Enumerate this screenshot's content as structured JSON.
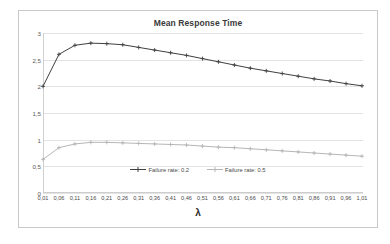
{
  "chart_data": {
    "type": "line",
    "title": "Mean Response Time",
    "xlabel": "λ",
    "ylabel": "",
    "xlim": [
      0.01,
      1.01
    ],
    "ylim": [
      0,
      3
    ],
    "grid": true,
    "legend_position": "inside-bottom-center",
    "x": [
      0.01,
      0.06,
      0.11,
      0.16,
      0.21,
      0.26,
      0.31,
      0.36,
      0.41,
      0.46,
      0.51,
      0.56,
      0.61,
      0.66,
      0.71,
      0.76,
      0.81,
      0.86,
      0.91,
      0.96,
      1.01
    ],
    "xtick_labels": [
      "0,01",
      "0,06",
      "0,11",
      "0,16",
      "0,21",
      "0,26",
      "0,31",
      "0,36",
      "0,41",
      "0,46",
      "0,51",
      "0,56",
      "0,61",
      "0,66",
      "0,71",
      "0,76",
      "0,81",
      "0,86",
      "0,91",
      "0,96",
      "1,01"
    ],
    "ytick_values": [
      0,
      0.5,
      1,
      1.5,
      2,
      2.5,
      3
    ],
    "ytick_labels": [
      "0",
      "0,5",
      "1",
      "1,5",
      "2",
      "2,5",
      "3"
    ],
    "series": [
      {
        "name": "Failure rate: 0.2",
        "color": "#404040",
        "marker": "cross",
        "values": [
          2.0,
          2.6,
          2.77,
          2.81,
          2.8,
          2.78,
          2.73,
          2.68,
          2.63,
          2.58,
          2.52,
          2.46,
          2.4,
          2.34,
          2.29,
          2.24,
          2.19,
          2.14,
          2.1,
          2.05,
          2.01
        ]
      },
      {
        "name": "Failure rate: 0.5",
        "color": "#b6b6b6",
        "marker": "cross",
        "values": [
          0.63,
          0.85,
          0.92,
          0.95,
          0.95,
          0.94,
          0.93,
          0.92,
          0.91,
          0.9,
          0.88,
          0.86,
          0.85,
          0.83,
          0.81,
          0.79,
          0.77,
          0.75,
          0.73,
          0.71,
          0.69
        ]
      }
    ]
  },
  "legend": {
    "items": [
      {
        "label": "Failure rate: 0.2",
        "color": "#404040"
      },
      {
        "label": "Failure rate: 0.5",
        "color": "#b6b6b6"
      }
    ]
  }
}
